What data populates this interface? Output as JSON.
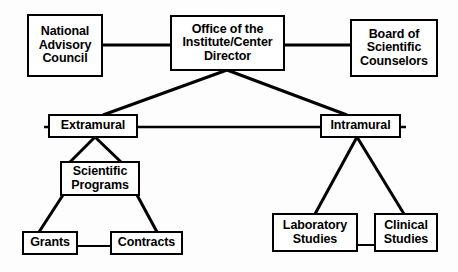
{
  "diagram": {
    "background_color": "#fdfdfd",
    "line_color": "#000000",
    "box_fill_color": "#ffffff",
    "nodes": [
      {
        "id": "national-advisory-council",
        "label": "National\nAdvisory\nCouncil"
      },
      {
        "id": "office-director",
        "label": "Office of the\nInstitute/Center\nDirector"
      },
      {
        "id": "board-scientific-counselors",
        "label": "Board of\nScientific\nCounselors"
      },
      {
        "id": "extramural",
        "label": "Extramural"
      },
      {
        "id": "intramural",
        "label": "Intramural"
      },
      {
        "id": "scientific-programs",
        "label": "Scientific\nPrograms"
      },
      {
        "id": "grants",
        "label": "Grants"
      },
      {
        "id": "contracts",
        "label": "Contracts"
      },
      {
        "id": "laboratory-studies",
        "label": "Laboratory\nStudies"
      },
      {
        "id": "clinical-studies",
        "label": "Clinical\nStudies"
      }
    ],
    "edges": [
      {
        "from": "national-advisory-council",
        "to": "office-director",
        "style": "horizontal"
      },
      {
        "from": "office-director",
        "to": "board-scientific-counselors",
        "style": "horizontal"
      },
      {
        "from": "office-director",
        "to": "extramural",
        "style": "diagonal"
      },
      {
        "from": "office-director",
        "to": "intramural",
        "style": "diagonal"
      },
      {
        "from": "extramural",
        "to": "intramural",
        "style": "horizontal"
      },
      {
        "from": "extramural",
        "to": "scientific-programs",
        "style": "diagonal-pair"
      },
      {
        "from": "scientific-programs",
        "to": "grants",
        "style": "diagonal"
      },
      {
        "from": "scientific-programs",
        "to": "contracts",
        "style": "diagonal"
      },
      {
        "from": "grants",
        "to": "contracts",
        "style": "horizontal"
      },
      {
        "from": "intramural",
        "to": "laboratory-studies",
        "style": "diagonal"
      },
      {
        "from": "intramural",
        "to": "clinical-studies",
        "style": "diagonal"
      },
      {
        "from": "laboratory-studies",
        "to": "clinical-studies",
        "style": "horizontal"
      }
    ]
  }
}
